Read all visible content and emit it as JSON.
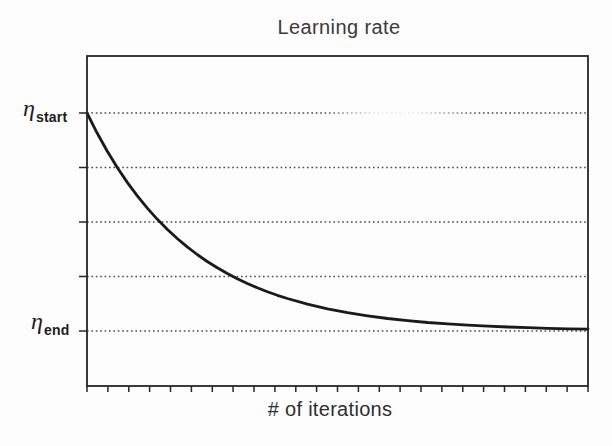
{
  "chart_data": {
    "type": "line",
    "title": "Learning rate",
    "xlabel": "# of iterations",
    "ylabel": "",
    "legend": "none",
    "grid": "horizontal-dotted",
    "y_axis_labels": [
      {
        "symbol": "η",
        "subscript": "start",
        "level": 1.0
      },
      {
        "symbol": "η",
        "subscript": "end",
        "level": 0.0
      }
    ],
    "gridline_levels": [
      1.0,
      0.75,
      0.5,
      0.25,
      0.0
    ],
    "x_axis": {
      "tick_count": 25,
      "numeric_labels_shown": false,
      "range_norm": [
        0,
        1
      ]
    },
    "y_range_norm": [
      -0.26,
      1.26
    ],
    "series": [
      {
        "name": "learning-rate-decay",
        "model": "eta(t) = eta_end + (eta_start - eta_end) * exp(-t / (0.21 * T))",
        "points": [
          [
            0.0,
            1.0
          ],
          [
            0.02,
            0.9091
          ],
          [
            0.04,
            0.8266
          ],
          [
            0.06,
            0.7515
          ],
          [
            0.08,
            0.6832
          ],
          [
            0.1,
            0.6212
          ],
          [
            0.12,
            0.5647
          ],
          [
            0.14,
            0.5134
          ],
          [
            0.16,
            0.4668
          ],
          [
            0.18,
            0.4244
          ],
          [
            0.2,
            0.3859
          ],
          [
            0.22,
            0.3508
          ],
          [
            0.24,
            0.319
          ],
          [
            0.26,
            0.29
          ],
          [
            0.28,
            0.2637
          ],
          [
            0.3,
            0.2397
          ],
          [
            0.32,
            0.218
          ],
          [
            0.34,
            0.1982
          ],
          [
            0.36,
            0.1802
          ],
          [
            0.38,
            0.1638
          ],
          [
            0.4,
            0.1489
          ],
          [
            0.44,
            0.1231
          ],
          [
            0.48,
            0.1018
          ],
          [
            0.52,
            0.0841
          ],
          [
            0.56,
            0.0695
          ],
          [
            0.6,
            0.0574
          ],
          [
            0.64,
            0.0475
          ],
          [
            0.68,
            0.0392
          ],
          [
            0.72,
            0.0324
          ],
          [
            0.76,
            0.0268
          ],
          [
            0.8,
            0.0221
          ],
          [
            0.84,
            0.0183
          ],
          [
            0.88,
            0.0151
          ],
          [
            0.92,
            0.0125
          ],
          [
            0.96,
            0.0103
          ],
          [
            1.0,
            0.0085
          ]
        ]
      }
    ],
    "colors": {
      "ink": "#262626",
      "curve": "#1a1a1a",
      "grid": "#4a4a4a",
      "background": "#fdfdfd"
    },
    "artifacts": {
      "top_gridline_fade": {
        "x_norm_from": 0.47,
        "x_norm_to": 0.78
      }
    }
  }
}
